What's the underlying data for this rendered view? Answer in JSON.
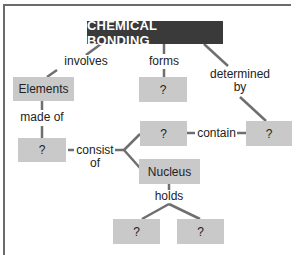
{
  "diagram": {
    "title": "CHEMICAL BONDING",
    "nodes": {
      "elements": "Elements",
      "forms_target": "?",
      "made_of_target": "?",
      "contain_source": "?",
      "contain_target": "?",
      "nucleus": "Nucleus",
      "holds_left": "?",
      "holds_right": "?"
    },
    "links": {
      "involves": "involves",
      "forms": "forms",
      "determined": "determined",
      "by": "by",
      "made_of": "made of",
      "consist": "consist",
      "of": "of",
      "contain": "contain",
      "holds": "holds"
    },
    "colors": {
      "title_bg": "#3a3a3a",
      "node_bg": "#c9c9c9",
      "line": "#6f6f6f"
    }
  }
}
